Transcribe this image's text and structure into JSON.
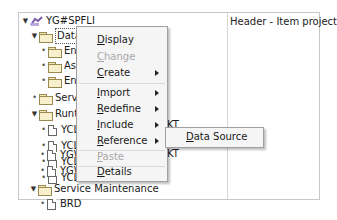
{
  "right_pane": {
    "header": "Header - Item project"
  },
  "tree": [
    {
      "label": "YG#SPFLI",
      "icon": "project-icon",
      "toggle": "expanded",
      "indent": 0
    },
    {
      "label": "Data M",
      "icon": "folder-open-icon",
      "toggle": "expanded",
      "indent": 1,
      "selected": true
    },
    {
      "label": "Entity",
      "icon": "folder-icon",
      "toggle": "leaf",
      "indent": 2
    },
    {
      "label": "Asso",
      "icon": "folder-icon",
      "toggle": "leaf",
      "indent": 2
    },
    {
      "label": "Entity",
      "icon": "folder-icon",
      "toggle": "leaf",
      "indent": 2
    },
    {
      "label": "Service",
      "icon": "folder-icon",
      "toggle": "leaf",
      "indent": 1
    },
    {
      "label": "Runtime",
      "icon": "folder-open-icon",
      "toggle": "expanded",
      "indent": 1
    },
    {
      "label": "YCL",
      "icon": "document-icon",
      "toggle": "leaf",
      "indent": 2
    },
    {
      "label": "YCL",
      "icon": "document-icon",
      "toggle": "leaf",
      "indent": 2,
      "suffix": "KT"
    },
    {
      "label": "YCL",
      "icon": "document-icon",
      "toggle": "leaf",
      "indent": 2
    },
    {
      "label": "YCL",
      "icon": "document-icon",
      "toggle": "leaf",
      "indent": 2,
      "suffix": "KT"
    },
    {
      "label": "YGW",
      "icon": "document-icon",
      "toggle": "leaf",
      "indent": 2
    },
    {
      "label": "YGW",
      "icon": "document-icon",
      "toggle": "leaf",
      "indent": 2
    },
    {
      "label": "Service Maintenance",
      "icon": "folder-open-icon",
      "toggle": "expanded",
      "indent": 1
    },
    {
      "label": "BRD",
      "icon": "document-icon",
      "toggle": "leaf",
      "indent": 2
    }
  ],
  "context_menu": {
    "items": [
      {
        "label": "Display",
        "mnemonic": "D",
        "enabled": true,
        "submenu": false
      },
      {
        "label": "Change",
        "mnemonic": "C",
        "enabled": false,
        "submenu": false
      },
      {
        "label": "Create",
        "mnemonic": "C",
        "enabled": true,
        "submenu": true
      },
      {
        "label": "Import",
        "mnemonic": "I",
        "enabled": true,
        "submenu": true
      },
      {
        "label": "Redefine",
        "mnemonic": "R",
        "enabled": true,
        "submenu": true
      },
      {
        "label": "Include",
        "mnemonic": "I",
        "enabled": true,
        "submenu": true
      },
      {
        "label": "Reference",
        "mnemonic": "R",
        "enabled": true,
        "submenu": true
      },
      {
        "label": "Paste",
        "mnemonic": "P",
        "enabled": false,
        "submenu": false
      },
      {
        "label": "Details",
        "mnemonic": "D",
        "enabled": true,
        "submenu": false
      }
    ]
  },
  "submenu": {
    "items": [
      {
        "label": "Data Source",
        "mnemonic": "D"
      }
    ]
  }
}
